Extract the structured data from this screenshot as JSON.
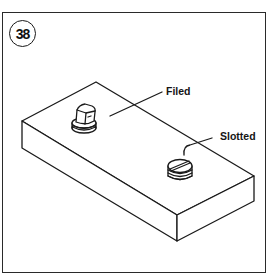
{
  "figure": {
    "number": "38",
    "labels": {
      "filed": "Filed",
      "slotted": "Slotted"
    },
    "parts": [
      {
        "name": "base-block",
        "description": "rectangular block shown in isometric view"
      },
      {
        "name": "filed-screw",
        "description": "screw with filed head"
      },
      {
        "name": "slotted-screw",
        "description": "screw with slotted head"
      }
    ],
    "colors": {
      "line": "#1a1a1a",
      "background": "#ffffff"
    }
  }
}
